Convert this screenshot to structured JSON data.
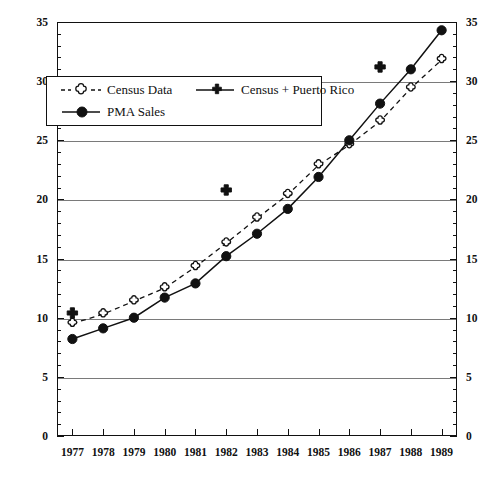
{
  "chart_data": {
    "type": "line",
    "title": "",
    "xlabel": "",
    "ylabel": "",
    "categories": [
      "1977",
      "1978",
      "1979",
      "1980",
      "1981",
      "1982",
      "1983",
      "1984",
      "1985",
      "1986",
      "1987",
      "1988",
      "1989"
    ],
    "xlim": [
      1976.5,
      1989.5
    ],
    "ylim": [
      0,
      35
    ],
    "ytick_labels": [
      "0",
      "5",
      "10",
      "15",
      "20",
      "25",
      "30",
      "35"
    ],
    "ytick_values": [
      0,
      5,
      10,
      15,
      20,
      25,
      30,
      35
    ],
    "yminor_step": 1,
    "grid": "horizontal-major",
    "dual_y_axis": true,
    "legend_position": "upper-left-inside",
    "series": [
      {
        "name": "Census Data",
        "marker": "open-cross",
        "line": "dashed",
        "values": [
          9.5,
          10.3,
          11.4,
          12.5,
          14.3,
          16.3,
          18.4,
          20.4,
          22.9,
          24.6,
          26.6,
          29.4,
          31.8
        ]
      },
      {
        "name": "Census + Puerto Rico",
        "marker": "filled-cross",
        "line": "none",
        "values": [
          10.4,
          null,
          null,
          null,
          null,
          20.8,
          null,
          null,
          null,
          null,
          31.2,
          null,
          null
        ]
      },
      {
        "name": "PMA Sales",
        "marker": "filled-circle",
        "line": "solid",
        "values": [
          8.2,
          9.1,
          10.0,
          11.7,
          12.9,
          15.2,
          17.1,
          19.2,
          21.9,
          25.0,
          28.1,
          31.0,
          34.3
        ]
      }
    ]
  },
  "legend": {
    "entries": [
      {
        "label": "Census Data"
      },
      {
        "label": "Census + Puerto Rico"
      },
      {
        "label": "PMA Sales"
      }
    ]
  },
  "colors": {
    "axis": "#111111",
    "grid": "#7a7a7a",
    "series_line": "#111111",
    "background": "#ffffff"
  }
}
